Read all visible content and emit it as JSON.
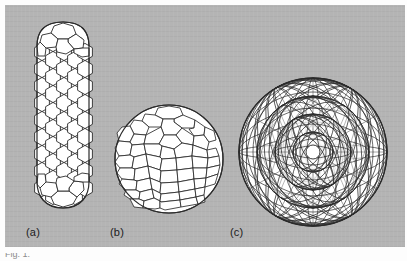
{
  "figure": {
    "panel_background": "#b4b4b4",
    "page_background": "#fdfdfd",
    "line_color": "#2b2b2b",
    "fill_color": "#ffffff",
    "labels": [
      {
        "text": "(a)",
        "name": "label-a"
      },
      {
        "text": "(b)",
        "name": "label-b"
      },
      {
        "text": "(c)",
        "name": "label-c"
      }
    ],
    "caption_fragment": "Fig. 1.",
    "structures": [
      {
        "id": "a",
        "name": "capped-carbon-nanotube",
        "description": "elongated capped single-wall carbon nanotube drawn as a hexagonal lattice cylinder with hemispherical fullerene end caps",
        "rows": 17,
        "columns": 7,
        "shape": "cylinder"
      },
      {
        "id": "b",
        "name": "giant-fullerene-sphere",
        "description": "quasi-spherical giant fullerene cage of hexagons with pentagons at the vertices",
        "shells": 1,
        "shape": "sphere"
      },
      {
        "id": "c",
        "name": "multishell-carbon-onion",
        "description": "multi-shell nested fullerene onion, several concentric polyhedral cages seen through one another",
        "shells": 4,
        "shape": "onion"
      }
    ]
  }
}
